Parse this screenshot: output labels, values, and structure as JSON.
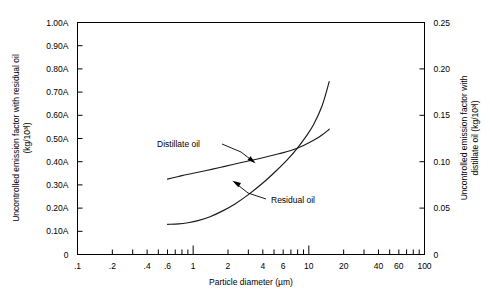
{
  "chart_data": {
    "type": "line",
    "title": "",
    "xlabel": "Particle diameter (µm)",
    "ylabel": "Uncontrolled emission factor with residual oil (kg/10³l)",
    "y2label": "Uncontrolled emission factor with distillate oil (kg/10³l)",
    "xscale": "log",
    "xlim": [
      0.1,
      100
    ],
    "ylim": [
      0,
      1.0
    ],
    "y2lim": [
      0,
      0.25
    ],
    "grid": false,
    "legend_position": "inline-annotations",
    "x_tick_labels": [
      ".1",
      ".2",
      ".4",
      ".6",
      "1",
      "2",
      "4",
      "6",
      "10",
      "20",
      "40",
      "60",
      "100"
    ],
    "x_tick_values": [
      0.1,
      0.2,
      0.4,
      0.6,
      1,
      2,
      4,
      6,
      10,
      20,
      40,
      60,
      100
    ],
    "x_major_values": [
      0.1,
      1,
      10,
      100
    ],
    "y_tick_labels": [
      "0",
      "0.10A",
      "0.20A",
      "0.30A",
      "0.40A",
      "0.50A",
      "0.60A",
      "0.70A",
      "0.80A",
      "0.90A",
      "1.00A"
    ],
    "y_tick_values": [
      0,
      0.1,
      0.2,
      0.3,
      0.4,
      0.5,
      0.6,
      0.7,
      0.8,
      0.9,
      1.0
    ],
    "y2_tick_labels": [
      "0",
      "0.05",
      "0.10",
      "0.15",
      "0.20",
      "0.25"
    ],
    "y2_tick_values": [
      0,
      0.05,
      0.1,
      0.15,
      0.2,
      0.25
    ],
    "series": [
      {
        "name": "Distillate oil",
        "axis": "left",
        "annotation": "Distillate oil",
        "x": [
          0.6,
          0.7,
          0.8,
          1.0,
          1.3,
          1.7,
          2.2,
          3.0,
          4.0,
          5.5,
          7.0,
          9.0,
          11.0,
          13.0,
          15.0
        ],
        "y": [
          0.325,
          0.333,
          0.34,
          0.35,
          0.362,
          0.375,
          0.388,
          0.403,
          0.417,
          0.434,
          0.448,
          0.47,
          0.492,
          0.515,
          0.54
        ]
      },
      {
        "name": "Residual oil",
        "axis": "left",
        "annotation": "Residual oil",
        "x": [
          0.6,
          0.75,
          0.9,
          1.1,
          1.4,
          1.8,
          2.3,
          3.0,
          4.0,
          5.2,
          6.5,
          8.0,
          9.5,
          11.0,
          13.0,
          15.0
        ],
        "y": [
          0.13,
          0.132,
          0.137,
          0.146,
          0.163,
          0.188,
          0.218,
          0.258,
          0.308,
          0.36,
          0.408,
          0.46,
          0.51,
          0.56,
          0.64,
          0.745
        ]
      }
    ],
    "annotations": [
      {
        "label": "Distillate oil",
        "target_x": 2.6,
        "target_y": 0.395
      },
      {
        "label": "Residual oil",
        "target_x": 4.3,
        "target_y": 0.322
      }
    ]
  },
  "axes": {
    "left_title_line1": "Uncontrolled emission factor with residual oil",
    "left_title_line2": "(kg/10³l)",
    "right_title_line1": "Uncontrolled emission factor with",
    "right_title_line2": "distillate oil (kg/10³l)",
    "bottom_title": "Particle diameter (µm)"
  }
}
